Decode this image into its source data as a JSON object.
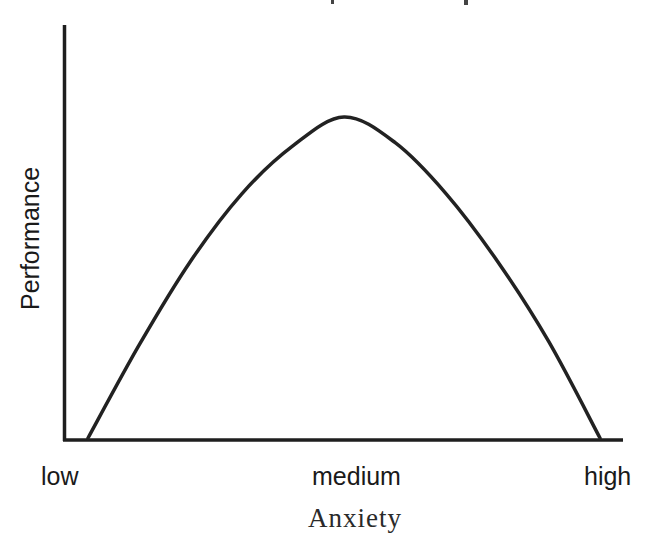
{
  "chart_data": {
    "type": "line",
    "title": "",
    "xlabel": "Anxiety",
    "ylabel": "Performance",
    "categories": [
      "low",
      "medium",
      "high"
    ],
    "x_tick_positions": [
      0,
      0.5,
      1
    ],
    "series": [
      {
        "name": "Performance vs Anxiety (inverted-U)",
        "x": [
          0.0,
          0.1,
          0.2,
          0.3,
          0.4,
          0.5,
          0.6,
          0.7,
          0.8,
          0.9,
          1.0
        ],
        "values": [
          0.0,
          0.29,
          0.55,
          0.76,
          0.91,
          1.0,
          0.92,
          0.76,
          0.55,
          0.3,
          0.0
        ]
      }
    ],
    "xlim": [
      0,
      1
    ],
    "ylim": [
      0,
      1.2
    ],
    "grid": false,
    "legend": "none",
    "color": "#222222"
  },
  "axes": {
    "x_tick_labels": [
      "low",
      "medium",
      "high"
    ],
    "x_title": "Anxiety",
    "y_title": "Performance"
  },
  "colors": {
    "line": "#222222",
    "axis": "#1e1e1e",
    "background": "#ffffff"
  }
}
